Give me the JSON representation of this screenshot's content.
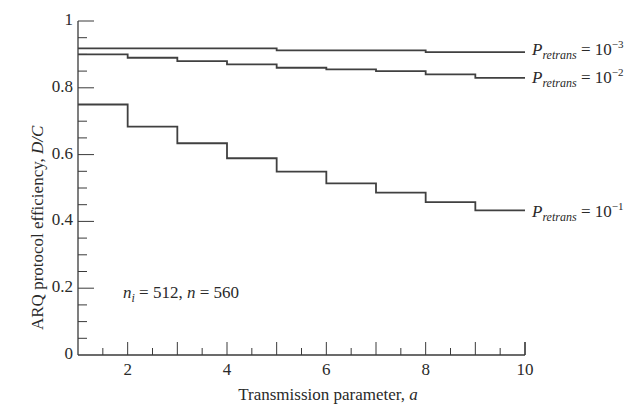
{
  "chart_data": {
    "type": "line",
    "subtype": "step",
    "title": "",
    "xlabel": "Transmission parameter, a",
    "ylabel": "ARQ protocol efficiency, D/C",
    "xlim": [
      1,
      10
    ],
    "ylim": [
      0,
      1
    ],
    "xticks": [
      2,
      4,
      6,
      8,
      10
    ],
    "yticks": [
      0,
      0.2,
      0.4,
      0.6,
      0.8,
      1
    ],
    "xtick_labels": [
      "2",
      "4",
      "6",
      "8",
      "10"
    ],
    "ytick_labels": [
      "0",
      "0.2",
      "0.4",
      "0.6",
      "0.8",
      "1"
    ],
    "grid": false,
    "legend_position": "inline-right",
    "annotation": "n_i = 512, n = 560",
    "x": [
      1,
      2,
      3,
      4,
      5,
      6,
      7,
      8,
      9,
      10
    ],
    "series": [
      {
        "name": "P_retrans = 10^-3",
        "label_main": "P",
        "label_sub": "retrans",
        "label_eq": " = 10",
        "label_exp": "−3",
        "values": [
          0.918,
          0.918,
          0.918,
          0.918,
          0.912,
          0.912,
          0.912,
          0.907,
          0.907,
          0.907
        ]
      },
      {
        "name": "P_retrans = 10^-2",
        "label_main": "P",
        "label_sub": "retrans",
        "label_eq": " = 10",
        "label_exp": "−2",
        "values": [
          0.9,
          0.89,
          0.88,
          0.87,
          0.86,
          0.855,
          0.85,
          0.84,
          0.83,
          0.83
        ]
      },
      {
        "name": "P_retrans = 10^-1",
        "label_main": "P",
        "label_sub": "retrans",
        "label_eq": " = 10",
        "label_exp": "−1",
        "values": [
          0.75,
          0.684,
          0.634,
          0.589,
          0.549,
          0.514,
          0.486,
          0.458,
          0.433,
          0.433
        ]
      }
    ]
  },
  "annotation": {
    "n_main": "n",
    "n_sub": "i",
    "text_rest": " = 512, ",
    "n2": "n",
    "text_end": " = 560"
  },
  "axes": {
    "xlabel_text": "Transmission parameter, ",
    "xlabel_var": "a",
    "ylabel_text": "ARQ protocol efficiency, ",
    "ylabel_var": "D/C"
  }
}
